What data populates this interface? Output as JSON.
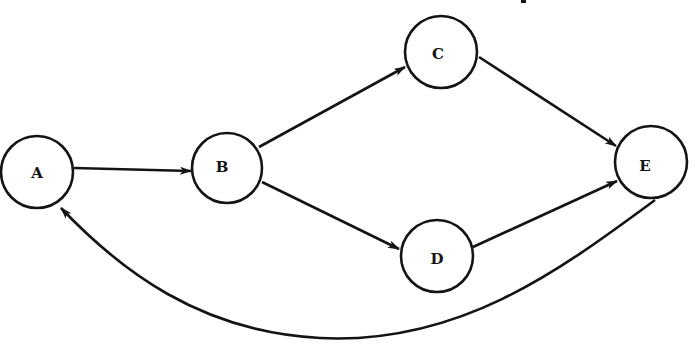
{
  "diagram": {
    "type": "directed-graph",
    "stroke_color": "#141414",
    "background": "#ffffff",
    "nodes": [
      {
        "id": "A",
        "label": "A",
        "cx": 37,
        "cy": 172,
        "r": 36
      },
      {
        "id": "B",
        "label": "B",
        "cx": 227,
        "cy": 168,
        "r": 35
      },
      {
        "id": "C",
        "label": "C",
        "cx": 441,
        "cy": 52,
        "r": 36
      },
      {
        "id": "D",
        "label": "D",
        "cx": 437,
        "cy": 256,
        "r": 36
      },
      {
        "id": "E",
        "label": "E",
        "cx": 651,
        "cy": 162,
        "r": 36
      }
    ],
    "edges": [
      {
        "from": "A",
        "to": "B",
        "shape": "straight",
        "arrow_at": "B"
      },
      {
        "from": "B",
        "to": "C",
        "shape": "straight",
        "arrow_at": "C"
      },
      {
        "from": "B",
        "to": "D",
        "shape": "straight",
        "arrow_at": "D"
      },
      {
        "from": "C",
        "to": "E",
        "shape": "straight",
        "arrow_at": "E"
      },
      {
        "from": "D",
        "to": "E",
        "shape": "straight",
        "arrow_at": "E"
      },
      {
        "from": "E",
        "to": "A",
        "shape": "curved-below",
        "arrow_at": "A"
      }
    ]
  }
}
